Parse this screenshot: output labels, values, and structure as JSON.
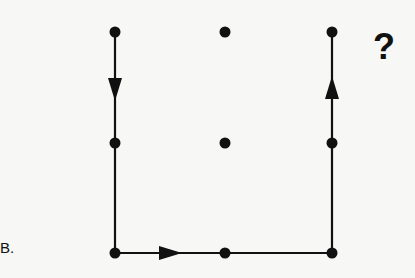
{
  "diagram": {
    "label": "B.",
    "question_mark": "?",
    "grid": {
      "columns_x": [
        115,
        225,
        332
      ],
      "rows_y": [
        32,
        143,
        253
      ]
    },
    "dots": [
      {
        "col": 0,
        "row": 0
      },
      {
        "col": 1,
        "row": 0
      },
      {
        "col": 2,
        "row": 0
      },
      {
        "col": 0,
        "row": 1
      },
      {
        "col": 1,
        "row": 1
      },
      {
        "col": 2,
        "row": 1
      },
      {
        "col": 0,
        "row": 2
      },
      {
        "col": 1,
        "row": 2
      },
      {
        "col": 2,
        "row": 2
      }
    ],
    "path": [
      {
        "from": [
          0,
          0
        ],
        "to": [
          0,
          2
        ],
        "arrow": "down"
      },
      {
        "from": [
          0,
          2
        ],
        "to": [
          2,
          2
        ],
        "arrow": "right"
      },
      {
        "from": [
          2,
          2
        ],
        "to": [
          2,
          0
        ],
        "arrow": "up"
      }
    ],
    "colors": {
      "ink": "#111111",
      "background": "#f7f7f5"
    }
  }
}
